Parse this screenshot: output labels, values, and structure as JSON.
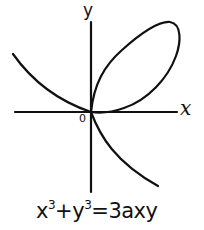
{
  "diagram": {
    "axes": {
      "x_label": "x",
      "y_label": "y",
      "origin_label": "0"
    },
    "equation": {
      "lhs_term1_base": "x",
      "lhs_term1_exp": "3",
      "plus": "+",
      "lhs_term2_base": "y",
      "lhs_term2_exp": "3",
      "equals": "=",
      "rhs": "3axy",
      "full_text": "x³+y³=3axy"
    },
    "colors": {
      "ink": "#111111",
      "background": "#ffffff"
    },
    "curve": {
      "name": "folium",
      "components": [
        "loop (first quadrant)",
        "left branch (second quadrant)",
        "lower branch (fourth quadrant)"
      ]
    }
  }
}
